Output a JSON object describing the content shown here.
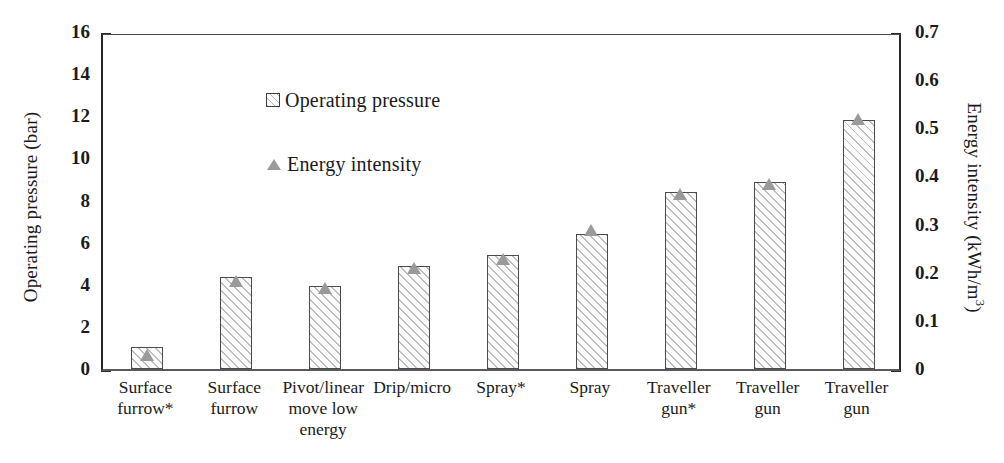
{
  "chart_data": {
    "type": "bar",
    "title": "",
    "xlabel": "",
    "ylabel": "Operating pressure (bar)",
    "y2label": "Energy intensity (kWh/m",
    "y2label_sup": "3",
    "y2label_tail": ")",
    "categories": [
      "Surface furrow*",
      "Surface furrow",
      "Pivot/linear move low energy",
      "Drip/micro",
      "Spray*",
      "Spray",
      "Traveller gun*",
      "Traveller gun",
      "Traveller gun"
    ],
    "category_lines": [
      [
        "Surface",
        "furrow*"
      ],
      [
        "Surface",
        "furrow"
      ],
      [
        "Pivot/linear",
        "move low",
        "energy"
      ],
      [
        "Drip/micro"
      ],
      [
        "Spray*"
      ],
      [
        "Spray"
      ],
      [
        "Traveller",
        "gun*"
      ],
      [
        "Traveller",
        "gun"
      ],
      [
        "Traveller",
        "gun"
      ]
    ],
    "series": [
      {
        "name": "Operating pressure",
        "axis": "left",
        "unit": "bar",
        "marker": "hatched-square",
        "values": [
          1.05,
          4.35,
          3.95,
          4.9,
          5.4,
          6.4,
          8.4,
          8.9,
          11.8
        ]
      },
      {
        "name": "Energy intensity",
        "axis": "right",
        "unit": "kWh/m3",
        "marker": "triangle",
        "values": [
          0.035,
          0.19,
          0.175,
          0.215,
          0.235,
          0.295,
          0.37,
          0.39,
          0.525
        ]
      }
    ],
    "ylim": [
      0,
      16
    ],
    "yticks": [
      0,
      2,
      4,
      6,
      8,
      10,
      12,
      14,
      16
    ],
    "y_minor_step": 1,
    "y2lim": [
      0,
      0.7
    ],
    "y2ticks": [
      "0",
      "0.1",
      "0.2",
      "0.3",
      "0.4",
      "0.5",
      "0.6",
      "0.7"
    ],
    "y2tick_values": [
      0,
      0.1,
      0.2,
      0.3,
      0.4,
      0.5,
      0.6,
      0.7
    ],
    "y2_minor_step": 0.05,
    "grid": false,
    "legend_position": "top-left",
    "legend": [
      {
        "label": "Operating pressure",
        "marker": "hatched-square"
      },
      {
        "label": "Energy intensity",
        "marker": "triangle"
      }
    ],
    "colors": {
      "bar_border": "#4b4b4b",
      "bar_hatch": "#bdbdbd",
      "bar_fill": "#fbfbfb",
      "triangle": "#9a9a9a",
      "axis": "#262626",
      "text": "#1a1a1a"
    }
  }
}
